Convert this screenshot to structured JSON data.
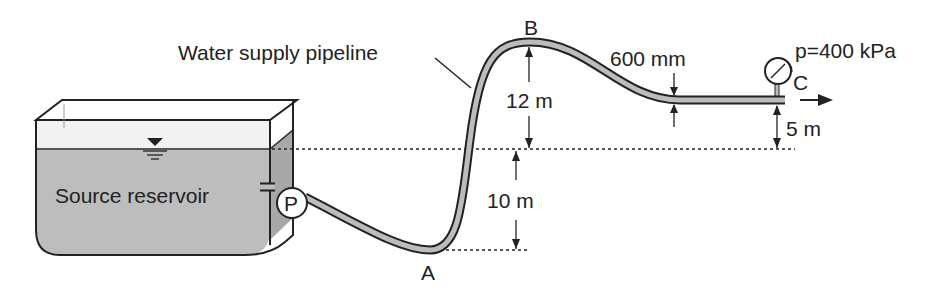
{
  "diagram": {
    "title_label": "Water supply pipeline",
    "reservoir_label": "Source reservoir",
    "pump_label": "P",
    "point_a": "A",
    "point_b": "B",
    "point_c": "C",
    "pressure_label": "p=400 kPa",
    "diameter_label": "600 mm",
    "height_b_label": "12 m",
    "depth_a_label": "10 m",
    "height_c_label": "5 m"
  }
}
